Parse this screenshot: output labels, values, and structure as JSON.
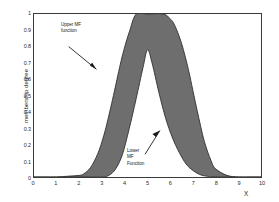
{
  "figure": {
    "background": "#ffffff",
    "axis_color": "#3a3a3a"
  },
  "axes": {
    "xlabel": "X",
    "ylabel": "membership degree",
    "xticks": [
      "0",
      "1",
      "2",
      "3",
      "4",
      "5",
      "6",
      "7",
      "8",
      "9",
      "10"
    ],
    "yticks": [
      "0",
      "0.1",
      "0.2",
      "0.3",
      "0.4",
      "0.5",
      "0.6",
      "0.7",
      "0.8",
      "0.9",
      "1"
    ]
  },
  "annotations": {
    "upper": "Upper MF\nfunction",
    "lower": "Lower\nMF\nFunction"
  },
  "chart_data": {
    "type": "area",
    "title": "",
    "xlabel": "X",
    "ylabel": "membership degree",
    "xlim": [
      0,
      10
    ],
    "ylim": [
      0,
      1
    ],
    "grid": false,
    "legend": null,
    "fill_color": "#6e6e6e",
    "line_color": "#2e2e2e",
    "series": [
      {
        "name": "Upper MF function",
        "x": [
          0,
          0.5,
          1,
          1.5,
          2,
          2.2,
          2.5,
          2.8,
          3,
          3.2,
          3.5,
          3.8,
          4,
          4.2,
          4.5,
          5,
          5.7,
          6,
          6.2,
          6.5,
          6.8,
          7,
          7.2,
          7.5,
          7.8,
          8,
          8.5,
          9,
          9.5,
          10
        ],
        "y": [
          0,
          0,
          0,
          0.005,
          0.01,
          0.02,
          0.06,
          0.14,
          0.22,
          0.32,
          0.5,
          0.69,
          0.8,
          0.89,
          1,
          1,
          1,
          0.97,
          0.93,
          0.82,
          0.66,
          0.53,
          0.4,
          0.22,
          0.1,
          0.05,
          0.01,
          0,
          0,
          0
        ]
      },
      {
        "name": "Lower MF Function",
        "x": [
          0,
          1,
          2,
          2.5,
          3,
          3.3,
          3.6,
          3.9,
          4.2,
          4.5,
          4.8,
          5,
          5.2,
          5.5,
          5.8,
          6.1,
          6.4,
          6.7,
          7,
          7.3,
          7.6,
          8,
          9,
          10
        ],
        "y": [
          0,
          0,
          0,
          0,
          0,
          0.01,
          0.05,
          0.14,
          0.3,
          0.48,
          0.67,
          0.78,
          0.7,
          0.52,
          0.36,
          0.24,
          0.15,
          0.08,
          0.04,
          0.015,
          0.005,
          0,
          0,
          0
        ]
      }
    ]
  }
}
